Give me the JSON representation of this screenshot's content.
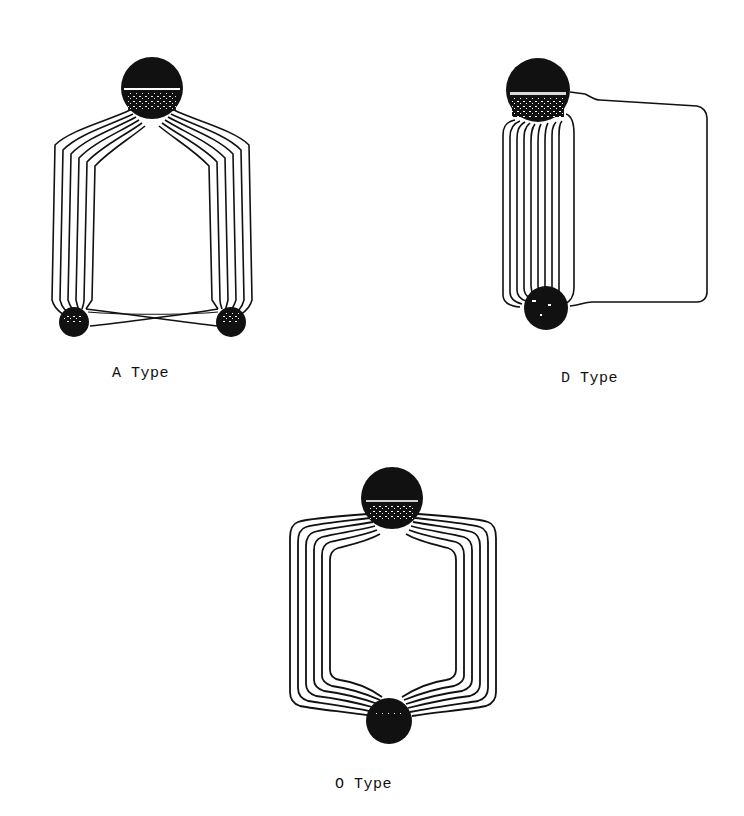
{
  "figure": {
    "panels": [
      {
        "id": "a",
        "label": "A Type",
        "description": "One large ball at top with two bundles of 6 looping wires fanning out left and right down to two small balls at bottom; small balls joined by crossing wires",
        "wire_count_per_side": 6
      },
      {
        "id": "d",
        "label": "D Type",
        "description": "Large ball at top-left and smaller ball at bottom-left joined by a vertical bundle of tightly packed loops, plus one large single loop extending to the right",
        "wire_count_bundle": 8,
        "wire_count_outer": 1
      },
      {
        "id": "o",
        "label": "O Type",
        "description": "Large ball at top and smaller ball at bottom joined by two symmetric bundles of 6 rounded rectangular loops on left and right",
        "wire_count_per_side": 6
      }
    ],
    "colors": {
      "ink": "#111111",
      "background": "#ffffff"
    }
  }
}
